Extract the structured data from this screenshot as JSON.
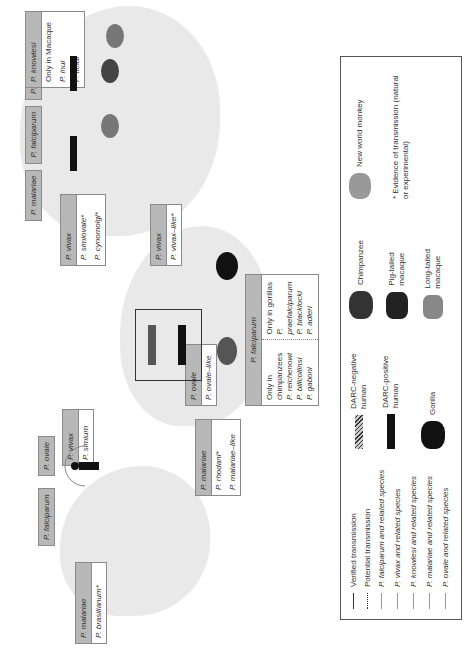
{
  "figure": {
    "orientation": "rotated 90 degrees counterclockwise",
    "regions": {
      "south_america": {
        "boxes": [
          {
            "header": "P. malariae",
            "body": [
              "P. brasilianum*"
            ]
          },
          {
            "header": "P. falciparum",
            "body": []
          },
          {
            "header": "P. ovale",
            "body": []
          },
          {
            "header": "P. vivax",
            "body": [
              "P. simium"
            ]
          }
        ]
      },
      "africa": {
        "boxes": [
          {
            "header": "P. malariae",
            "body": [
              "P. rhodani*",
              "P. malariae–like"
            ]
          },
          {
            "header": "P. ovale",
            "body": [
              "P. ovale–like"
            ]
          },
          {
            "header": "P. vivax",
            "body": [
              "P. vivax–like*"
            ]
          }
        ],
        "falciparum_box": {
          "header": "P. falciparum",
          "left_col": [
            "Only in",
            "chimpanzees",
            "P. reichenowi",
            "P. billcollinsi",
            "P. gaboni"
          ],
          "right_col": [
            "Only in gorillas",
            "P. praefalciparum",
            "P. blacklocki",
            "P. adleri"
          ]
        }
      },
      "asia": {
        "header_row": [
          "P. malariae",
          "P. falciparum",
          "P. ovale",
          "P. knowlesi"
        ],
        "knowlesi_body": [
          "Only in Macaque",
          "P. inui",
          "P. fieldi"
        ],
        "vivax_box": {
          "header": "P. vivax",
          "body": [
            "P. simiovale*",
            "P. cynomolgi*"
          ]
        }
      }
    },
    "legend": {
      "lines": [
        {
          "label": "Verified transmission",
          "style": "solid-black"
        },
        {
          "label": "Potential transmission",
          "style": "dotted-black"
        },
        {
          "label": "P. falciparum and related species",
          "style": "solid-gray"
        },
        {
          "label": "P. vivax and related species",
          "style": "solid-gray"
        },
        {
          "label": "P. knowlesi and related species",
          "style": "solid-gray"
        },
        {
          "label": "P. malariae and related species",
          "style": "solid-gray"
        },
        {
          "label": "P. ovale and related species",
          "style": "solid-gray"
        }
      ],
      "hosts": [
        {
          "icon": "darc-negative-human-icon",
          "label": "DARC-negative human"
        },
        {
          "icon": "darc-positive-human-icon",
          "label": "DARC-positive human"
        },
        {
          "icon": "gorilla-icon",
          "label": "Gorilla"
        },
        {
          "icon": "chimpanzee-icon",
          "label": "Chimpanzee"
        },
        {
          "icon": "pig-tailed-macaque-icon",
          "label": "Pig-tailed macaque"
        },
        {
          "icon": "long-tailed-macaque-icon",
          "label": "Long-tailed macaque"
        },
        {
          "icon": "new-world-monkey-icon",
          "label": "New world monkey"
        }
      ],
      "note": "* Evidence of transmission (natural or experimental)"
    },
    "colors": {
      "header_gray": "#b8b8b8",
      "land_gray": "#e9e9e9",
      "border": "#8a8a8a"
    }
  }
}
